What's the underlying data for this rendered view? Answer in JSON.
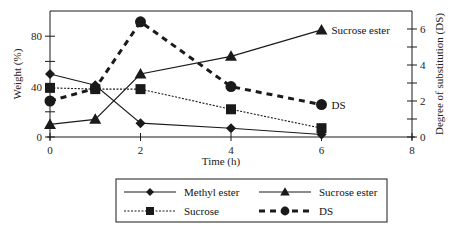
{
  "chart_data": {
    "type": "line",
    "title": "",
    "xlabel": "Time (h)",
    "ylabel": "Weight (%)",
    "y2label": "Degree of substitution (DS)",
    "xlim": [
      0,
      8
    ],
    "ylim": [
      0,
      100
    ],
    "y2lim": [
      0,
      7
    ],
    "xticks": [
      0,
      2,
      4,
      6,
      8
    ],
    "yticks": [
      0,
      40,
      80
    ],
    "yminor": [
      20,
      60
    ],
    "y2ticks": [
      0,
      2,
      4,
      6
    ],
    "y2minor": [
      1,
      3,
      5
    ],
    "grid": false,
    "legend_position": "below",
    "series": [
      {
        "name": "Methyl ester",
        "axis": "left",
        "marker": "diamond",
        "line": "solid",
        "x": [
          0,
          1,
          2,
          4,
          6
        ],
        "values": [
          50,
          41,
          11,
          7,
          2
        ]
      },
      {
        "name": "Sucrose ester",
        "axis": "left",
        "marker": "triangle",
        "line": "solid",
        "x": [
          0,
          1,
          2,
          4,
          6
        ],
        "values": [
          10,
          14,
          50,
          64,
          85
        ]
      },
      {
        "name": "Sucrose",
        "axis": "left",
        "marker": "square",
        "line": "dotted",
        "x": [
          0,
          1,
          2,
          4,
          6
        ],
        "values": [
          39,
          38,
          38,
          22,
          7
        ]
      },
      {
        "name": "DS",
        "axis": "right",
        "marker": "circle",
        "line": "dashed",
        "x": [
          0,
          1,
          2,
          4,
          6
        ],
        "values": [
          2.0,
          2.7,
          6.4,
          2.8,
          1.8
        ]
      }
    ],
    "annotations": [
      {
        "text": "Sucrose ester",
        "at_series": "Sucrose ester",
        "x": 6
      },
      {
        "text": "DS",
        "at_series": "DS",
        "x": 6
      }
    ]
  },
  "legend": {
    "items": [
      {
        "label": "Methyl ester"
      },
      {
        "label": "Sucrose ester"
      },
      {
        "label": "Sucrose"
      },
      {
        "label": "DS"
      }
    ]
  },
  "colors": {
    "ink": "#1a1a1a",
    "background": "#ffffff"
  }
}
